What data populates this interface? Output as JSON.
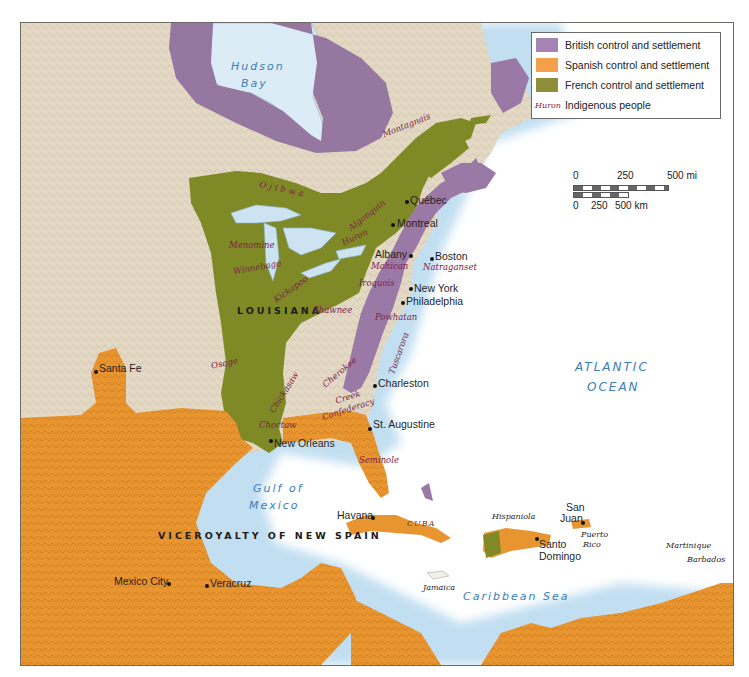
{
  "map": {
    "colors": {
      "british": "#9b79a6",
      "spanish": "#e8962e",
      "french": "#7f8a26",
      "land": "#e0d6c2",
      "water": "#ffffff",
      "lake": "#cde3f1",
      "coast_glow": "#cfe6f5",
      "indigenous_text": "#7c2348",
      "water_text": "#3a7dbb"
    },
    "legend": {
      "items": [
        {
          "label": "British control and settlement",
          "color": "#a583b3"
        },
        {
          "label": "Spanish control and settlement",
          "color": "#f5a04a"
        },
        {
          "label": "French control and settlement",
          "color": "#8e8d3a"
        }
      ],
      "indigenous_sample": "Huron",
      "indigenous_label": "Indigenous people"
    },
    "scale_bar": {
      "miles_ticks": [
        "0",
        "250",
        "500 mi"
      ],
      "km_ticks": [
        "0",
        "250",
        "500 km"
      ]
    },
    "water_bodies": {
      "hudson_bay_line1": "Hudson",
      "hudson_bay_line2": "Bay",
      "atlantic_line1": "ATLANTIC",
      "atlantic_line2": "OCEAN",
      "gulf_line1": "Gulf of",
      "gulf_line2": "Mexico",
      "caribbean": "Caribbean Sea"
    },
    "regions": {
      "louisiana": "LOUISIANA",
      "new_spain": "VICEROYALTY OF NEW SPAIN"
    },
    "cities": {
      "quebec": "Québec",
      "montreal": "Montreal",
      "albany": "Albany",
      "boston": "Boston",
      "new_york": "New York",
      "philadelphia": "Philadelphia",
      "charleston": "Charleston",
      "st_augustine": "St. Augustine",
      "new_orleans": "New Orleans",
      "santa_fe": "Santa Fe",
      "havana": "Havana",
      "mexico_city": "Mexico City",
      "veracruz": "Veracruz",
      "santo_domingo_line1": "Santo",
      "santo_domingo_line2": "Domingo",
      "san_juan_line1": "San",
      "san_juan_line2": "Juan"
    },
    "indigenous": {
      "montagnais": "Montagnais",
      "ojibwa": "Ojibwa",
      "algonquin": "Algonquin",
      "huron": "Huron",
      "menominee": "Menomine",
      "winnebago": "Winnebago",
      "kickapoo": "Kickapoo",
      "mohican": "Mohican",
      "narragansett": "Natraganset",
      "iroquois": "Iroquois",
      "powhatan": "Powhatan",
      "shawnee": "Shawnee",
      "tuscarora": "Tuscarora",
      "osage": "Osage",
      "chickasaw": "Chickasaw",
      "cherokee": "Cherokee",
      "creek_line1": "Creek",
      "creek_line2": "Confederacy",
      "choctaw": "Choctaw",
      "seminole": "Seminole"
    },
    "islands": {
      "cuba": "CUBA",
      "hispaniola": "Hispaniola",
      "puerto_rico_line1": "Puerto",
      "puerto_rico_line2": "Rico",
      "jamaica": "Jamaica",
      "martinique": "Martinique",
      "barbados": "Barbados"
    }
  }
}
